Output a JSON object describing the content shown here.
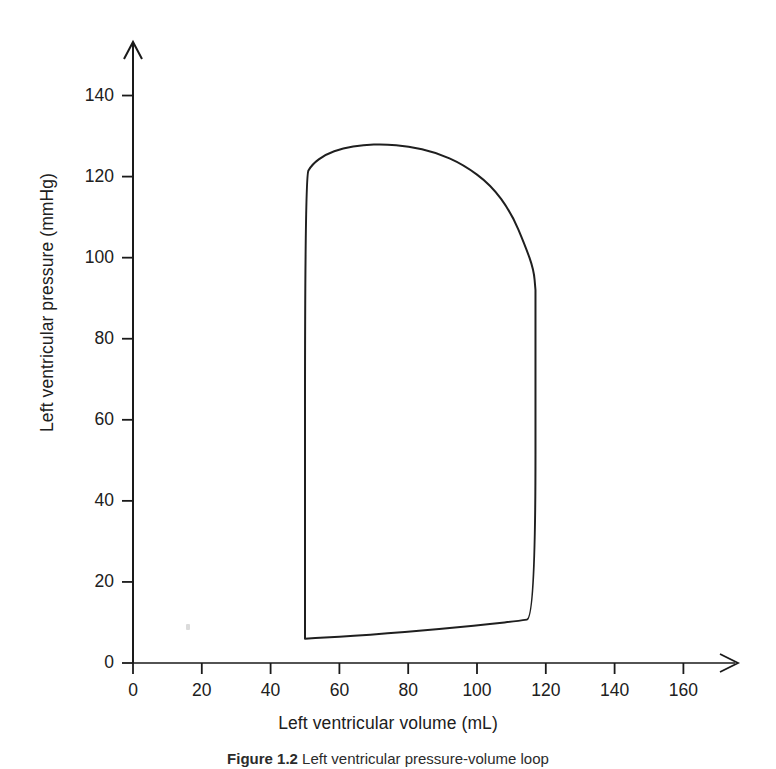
{
  "figure": {
    "caption_number": "Figure 1.2",
    "caption_text": "Left ventricular pressure-volume loop"
  },
  "chart_data": {
    "type": "line",
    "title": "",
    "xlabel": "Left ventricular volume (mL)",
    "ylabel": "Left ventricular pressure (mmHg)",
    "xlim": [
      0,
      175
    ],
    "ylim": [
      0,
      150
    ],
    "xticks": [
      0,
      20,
      40,
      60,
      80,
      100,
      120,
      140,
      160
    ],
    "yticks": [
      0,
      20,
      40,
      60,
      80,
      100,
      120,
      140
    ],
    "xtick_labels": [
      "0",
      "20",
      "40",
      "60",
      "80",
      "100",
      "120",
      "140",
      "160"
    ],
    "ytick_labels": [
      "0",
      "20",
      "40",
      "60",
      "80",
      "100",
      "120",
      "140"
    ],
    "grid": false,
    "legend": false,
    "axis_arrows": true,
    "series": [
      {
        "name": "Left ventricular pressure-volume loop",
        "closed": true,
        "x": [
          50,
          50,
          52,
          56,
          61,
          67,
          73,
          80,
          88,
          96,
          104,
          110,
          114,
          116.5,
          117,
          117,
          117,
          112,
          104,
          94,
          84,
          74,
          64,
          56,
          50
        ],
        "y": [
          6,
          120,
          123,
          125.5,
          127,
          127.8,
          128,
          127.5,
          126,
          123,
          118,
          111,
          103,
          97,
          92,
          92,
          11,
          10.4,
          9.6,
          8.8,
          8.0,
          7.3,
          6.7,
          6.3,
          6
        ]
      }
    ],
    "annotations": {
      "end_diastolic_volume": 117,
      "end_systolic_volume": 50,
      "peak_systolic_pressure": 128,
      "aortic_valve_open_pressure": 120,
      "aortic_valve_close_pressure": 92,
      "end_diastolic_pressure": 11,
      "min_diastolic_pressure": 6,
      "stroke_volume": 67
    }
  }
}
